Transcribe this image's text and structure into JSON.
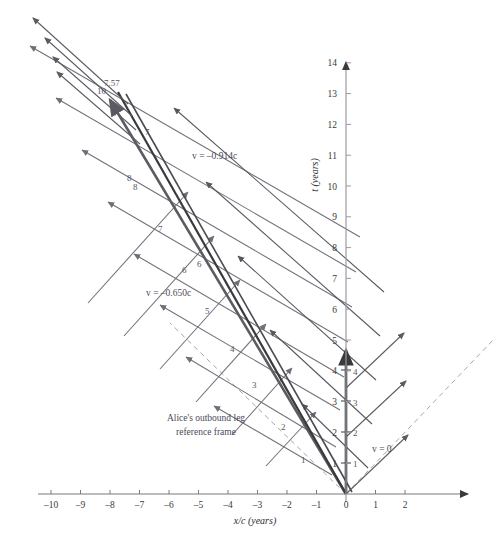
{
  "figure": {
    "type": "spacetime-diagram",
    "title": "",
    "background": "#ffffff"
  },
  "axes": {
    "x": {
      "label": "x/c (years)",
      "ticks": [
        -10,
        -9,
        -8,
        -7,
        -6,
        -5,
        -4,
        -3,
        -2,
        -1,
        0,
        1,
        2
      ],
      "tick_labels": [
        "–10",
        "–9",
        "–8",
        "–7",
        "–6",
        "–5",
        "–4",
        "–3",
        "–2",
        "–1",
        "0",
        "1",
        "2"
      ],
      "min": -10.5,
      "max": 2.9,
      "color": "#6b6b6b"
    },
    "t": {
      "label": "t (years)",
      "ticks": [
        1,
        2,
        3,
        4,
        5,
        6,
        7,
        8,
        9,
        10,
        11,
        12,
        13,
        14
      ],
      "tick_labels": [
        "1",
        "2",
        "3",
        "4",
        "5",
        "6",
        "7",
        "8",
        "9",
        "10",
        "11",
        "12",
        "13",
        "14"
      ],
      "min": 0,
      "max": 14.4,
      "color": "#8d8d8d"
    }
  },
  "colors": {
    "bob_worldline": "#3a3a3a",
    "alice_worldline": "#5b5b62",
    "grid_650": "#6f6f78",
    "grid_914": "#57575f",
    "lightcone": "#9a9aa4",
    "axis": "#7a7a7a",
    "text": "#44444c"
  },
  "annotations": [
    {
      "id": "v-zero",
      "text": "v = 0",
      "x": 372,
      "y": 452
    },
    {
      "id": "v-650",
      "text": "v = –0.650c",
      "x": 146,
      "y": 296
    },
    {
      "id": "v-914",
      "text": "v = –0.914c",
      "x": 192,
      "y": 159
    },
    {
      "id": "frame-note",
      "line1": "Alice's outbound leg",
      "line2": "reference frame",
      "x": 206,
      "y": 425
    }
  ],
  "tick_marks_on_bob_worldline": {
    "description": "Bob's proper-time tick labels plotted beside the vertical worldline",
    "labels": [
      "1",
      "2",
      "3",
      "4"
    ],
    "values": [
      1,
      2,
      3,
      4
    ]
  },
  "grid_650_labels": {
    "description": "proper time labels along the v = -0.650c family of lines",
    "labels": [
      "1",
      "2",
      "3",
      "4",
      "5",
      "6",
      "7",
      "8"
    ]
  },
  "grid_914_labels": {
    "description": "proper time labels along the v = -0.914c family of lines",
    "labels": [
      "6",
      "7",
      "8",
      "9",
      "10"
    ]
  },
  "special_value": {
    "label": "7.57",
    "value": 7.57,
    "x": 104,
    "y": 86
  },
  "chart_data": {
    "type": "line",
    "title": "",
    "xlabel": "x/c (years)",
    "ylabel": "t (years)",
    "xlim": [
      -10.5,
      2.9
    ],
    "ylim": [
      0,
      14.4
    ],
    "grid": false,
    "legend": "none",
    "series": [
      {
        "name": "Bob worldline (v = 0)",
        "style": "thick-solid",
        "x": [
          0,
          0
        ],
        "y": [
          0,
          4.65
        ]
      },
      {
        "name": "Alice outbound (v = -0.650c)",
        "style": "thick-solid",
        "x": [
          0,
          -8.1
        ],
        "y": [
          0,
          12.5
        ]
      },
      {
        "name": "Alice return leg (v = -0.914c)",
        "style": "thick-solid",
        "x": [
          0,
          -8.0
        ],
        "y": [
          0,
          12.3
        ]
      }
    ],
    "lightcone": {
      "style": "dashed",
      "slope_right": 1,
      "slope_left": -1
    },
    "annotations": [
      {
        "text": "v = 0",
        "x": 0.9,
        "y": 1.4
      },
      {
        "text": "v = –0.650c",
        "x": -6.6,
        "y": 6.4
      },
      {
        "text": "v = –0.914c",
        "x": -5.1,
        "y": 10.8
      },
      {
        "text": "Alice's outbound leg reference frame",
        "x": -4.7,
        "y": 2.3
      },
      {
        "text": "7.57",
        "x": -8.1,
        "y": 13.2
      }
    ]
  }
}
